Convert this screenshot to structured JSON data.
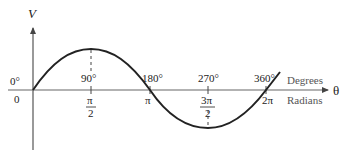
{
  "diagram": {
    "type": "sine-wave",
    "y_axis_label": "V",
    "x_axis_label": "θ",
    "row_labels": {
      "degrees": "Degrees",
      "radians": "Radians"
    },
    "origin": {
      "degree": "0°",
      "radian": "0"
    },
    "ticks": [
      {
        "degree": "90°",
        "radian_num": "π",
        "radian_den": "2"
      },
      {
        "degree": "180°",
        "radian": "π"
      },
      {
        "degree": "270°",
        "radian_num": "3π",
        "radian_den": "2"
      },
      {
        "degree": "360°",
        "radian": "2π"
      }
    ],
    "colors": {
      "curve": "#222222",
      "axis": "#555555",
      "text": "#222222"
    }
  }
}
